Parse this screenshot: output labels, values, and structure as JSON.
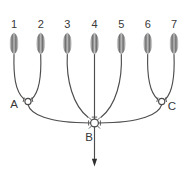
{
  "diagram": {
    "type": "neural-convergence-diagram",
    "colors": {
      "background": "#ffffff",
      "line": "#4d4d4d",
      "text": "#383838",
      "spindle_edge": "#ededed",
      "spindle_dark": "#6e6e6e",
      "spindle_highlight": "#b9b9b9"
    },
    "receptors": [
      {
        "label": "1"
      },
      {
        "label": "2"
      },
      {
        "label": "3"
      },
      {
        "label": "4"
      },
      {
        "label": "5"
      },
      {
        "label": "6"
      },
      {
        "label": "7"
      }
    ],
    "nodes": {
      "a": {
        "label": "A"
      },
      "b": {
        "label": "B"
      },
      "c": {
        "label": "C"
      }
    },
    "icons": {
      "output_arrow": "down-arrow-icon"
    }
  }
}
